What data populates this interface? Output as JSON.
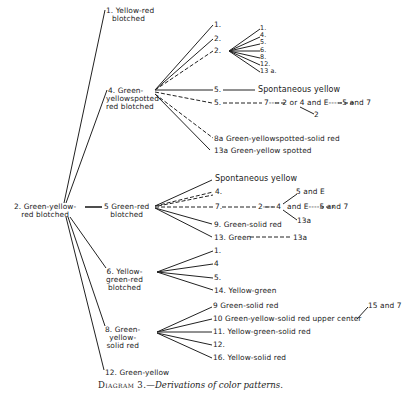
{
  "diagram": {
    "root": {
      "label_line1": "2. Green-yellow-",
      "label_line2": "red blotched"
    },
    "nodes": {
      "n1": {
        "label_line1": "1. Yellow-red",
        "label_line2": "blotched"
      },
      "n4": {
        "label_line1": "4. Green-",
        "label_line2": "yellowspotted-",
        "label_line3": "red blotched",
        "children": {
          "c1": "1.",
          "c2a": "2.",
          "c2b": "2.",
          "c2b_children": [
            "1.",
            "4.",
            "5.",
            "6.",
            "8.",
            "12.",
            "13 a."
          ],
          "c5a": "5.",
          "c5a_next": "Spontaneous yellow",
          "c5b": "5.",
          "c5b_chain": "7---- 2 or 4 and E-----5 and 7",
          "c5b_sub": "2",
          "c8a": "8a  Green-yellowspotted-solid red",
          "c13a": "13a  Green-yellow spotted"
        }
      },
      "n5": {
        "label_line1": "5 Green-red",
        "label_line2": "blotched",
        "children": {
          "spont": "Spontaneous yellow",
          "c4": "4.",
          "c7": "7.",
          "c7_chain_a": "2---- 4",
          "c7_up": "5 and E",
          "c7_down": "13a",
          "c7_chain_b": "and  E----5 and 7",
          "c9": "9. Green-solid red",
          "c13": "13. Green",
          "c13_chain": "13a"
        }
      },
      "n6": {
        "label_line1": "6. Yellow-",
        "label_line2": "green-red",
        "label_line3": "blotched",
        "children": [
          "1.",
          "4",
          "5.",
          "14. Yellow-green"
        ]
      },
      "n8": {
        "label_line1": "8. Green-",
        "label_line2": "yellow-",
        "label_line3": "solid red",
        "children": {
          "c9": "9  Green-solid red",
          "c10": "10  Green-yellow-solid red upper center",
          "c10_next": "15 and 7",
          "c11": "11. Yellow-green-solid red",
          "c12": "12.",
          "c16": "16. Yellow-solid red"
        }
      },
      "n12": {
        "label": "12. Green-yellow"
      }
    },
    "caption": {
      "prefix": "Diagram 3.",
      "text": "—Derivations of color patterns."
    }
  }
}
